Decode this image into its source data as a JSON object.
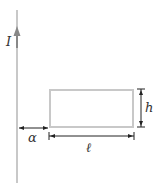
{
  "diagram": {
    "labels": {
      "current": "I",
      "distance": "α",
      "length": "ℓ",
      "height": "h"
    },
    "colors": {
      "wire": "#c8c8c8",
      "wire_arrow": "#888888",
      "loop": "#c8c8c8",
      "dimension_lines": "#222222",
      "text": "#333333"
    }
  }
}
